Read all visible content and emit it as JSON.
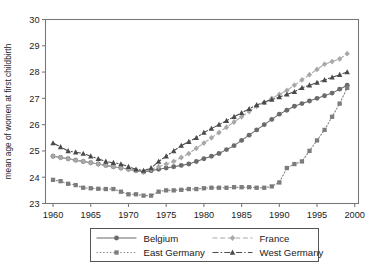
{
  "chart_data": {
    "type": "line",
    "title": "",
    "xlabel": "",
    "ylabel": "mean age of women at first childbirth",
    "xlim": [
      1959,
      2000.5
    ],
    "ylim": [
      23,
      30
    ],
    "xticks": [
      1960,
      1965,
      1970,
      1975,
      1980,
      1985,
      1990,
      1995,
      2000
    ],
    "yticks": [
      23,
      24,
      25,
      26,
      27,
      28,
      29,
      30
    ],
    "grid": false,
    "legend_position": "below-center",
    "legend_layout": "2x2",
    "series": [
      {
        "name": "Belgium",
        "color": "#6b6b6b",
        "marker": "circle",
        "linestyle": "solid",
        "x": [
          1960,
          1961,
          1962,
          1963,
          1964,
          1965,
          1966,
          1967,
          1968,
          1969,
          1970,
          1971,
          1972,
          1973,
          1974,
          1975,
          1976,
          1977,
          1978,
          1979,
          1980,
          1981,
          1982,
          1983,
          1984,
          1985,
          1986,
          1987,
          1988,
          1989,
          1990,
          1991,
          1992,
          1993,
          1994,
          1995,
          1996,
          1997,
          1998,
          1999
        ],
        "y": [
          24.8,
          24.75,
          24.7,
          24.65,
          24.6,
          24.55,
          24.5,
          24.45,
          24.4,
          24.35,
          24.3,
          24.25,
          24.2,
          24.25,
          24.3,
          24.35,
          24.4,
          24.45,
          24.5,
          24.6,
          24.7,
          24.8,
          24.9,
          25.05,
          25.2,
          25.4,
          25.6,
          25.8,
          26.0,
          26.2,
          26.4,
          26.55,
          26.7,
          26.8,
          26.9,
          27.0,
          27.1,
          27.2,
          27.35,
          27.5
        ]
      },
      {
        "name": "East Germany",
        "color": "#7c7c7c",
        "marker": "square",
        "linestyle": "dotted",
        "x": [
          1960,
          1961,
          1962,
          1963,
          1964,
          1965,
          1966,
          1967,
          1968,
          1969,
          1970,
          1971,
          1972,
          1973,
          1974,
          1975,
          1976,
          1977,
          1978,
          1979,
          1980,
          1981,
          1982,
          1983,
          1984,
          1985,
          1986,
          1987,
          1988,
          1989,
          1990,
          1991,
          1992,
          1993,
          1994,
          1995,
          1996,
          1997,
          1998,
          1999
        ],
        "y": [
          23.9,
          23.85,
          23.75,
          23.7,
          23.6,
          23.58,
          23.56,
          23.55,
          23.55,
          23.45,
          23.35,
          23.35,
          23.3,
          23.3,
          23.45,
          23.5,
          23.5,
          23.52,
          23.55,
          23.55,
          23.58,
          23.6,
          23.6,
          23.6,
          23.62,
          23.62,
          23.62,
          23.6,
          23.6,
          23.65,
          23.8,
          24.35,
          24.5,
          24.6,
          25.0,
          25.4,
          25.8,
          26.3,
          26.8,
          27.4
        ]
      },
      {
        "name": "France",
        "color": "#a8a8a8",
        "marker": "diamond",
        "linestyle": "dashed",
        "x": [
          1960,
          1961,
          1962,
          1963,
          1964,
          1965,
          1966,
          1967,
          1968,
          1969,
          1970,
          1971,
          1972,
          1973,
          1974,
          1975,
          1976,
          1977,
          1978,
          1979,
          1980,
          1981,
          1982,
          1983,
          1984,
          1985,
          1986,
          1987,
          1988,
          1989,
          1990,
          1991,
          1992,
          1993,
          1994,
          1995,
          1996,
          1997,
          1998,
          1999
        ],
        "y": [
          24.8,
          24.75,
          24.7,
          24.65,
          24.6,
          24.55,
          24.5,
          24.45,
          24.4,
          24.35,
          24.3,
          24.25,
          24.2,
          24.3,
          24.4,
          24.5,
          24.6,
          24.75,
          24.9,
          25.1,
          25.3,
          25.5,
          25.7,
          25.9,
          26.1,
          26.3,
          26.5,
          26.7,
          26.85,
          27.0,
          27.15,
          27.3,
          27.5,
          27.7,
          27.9,
          28.1,
          28.3,
          28.4,
          28.5,
          28.7
        ]
      },
      {
        "name": "West Germany",
        "color": "#4a4a4a",
        "marker": "triangle",
        "linestyle": "dashdot",
        "x": [
          1960,
          1961,
          1962,
          1963,
          1964,
          1965,
          1966,
          1967,
          1968,
          1969,
          1970,
          1971,
          1972,
          1973,
          1974,
          1975,
          1976,
          1977,
          1978,
          1979,
          1980,
          1981,
          1982,
          1983,
          1984,
          1985,
          1986,
          1987,
          1988,
          1989,
          1990,
          1991,
          1992,
          1993,
          1994,
          1995,
          1996,
          1997,
          1998,
          1999
        ],
        "y": [
          25.3,
          25.15,
          25.0,
          24.95,
          24.9,
          24.8,
          24.7,
          24.6,
          24.55,
          24.5,
          24.4,
          24.3,
          24.25,
          24.35,
          24.6,
          24.8,
          25.0,
          25.2,
          25.35,
          25.5,
          25.7,
          25.85,
          26.0,
          26.15,
          26.3,
          26.45,
          26.6,
          26.75,
          26.85,
          26.95,
          27.05,
          27.15,
          27.25,
          27.4,
          27.5,
          27.6,
          27.7,
          27.8,
          27.9,
          28.0
        ]
      }
    ]
  },
  "legend": {
    "entries": [
      {
        "label": "Belgium"
      },
      {
        "label": "France"
      },
      {
        "label": "East Germany"
      },
      {
        "label": "West Germany"
      }
    ]
  }
}
